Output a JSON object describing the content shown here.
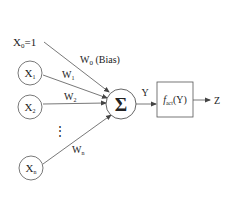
{
  "diagram": {
    "bias_input": {
      "label": "X",
      "sub": "0",
      "suffix": "=1"
    },
    "bias_weight": {
      "label": "W",
      "sub": "0",
      "suffix": " (Bias)"
    },
    "inputs": [
      {
        "label": "X",
        "sub": "1",
        "weight": "W",
        "weight_sub": "1"
      },
      {
        "label": "X",
        "sub": "2",
        "weight": "W",
        "weight_sub": "2"
      },
      {
        "label": "X",
        "sub": "n",
        "weight": "W",
        "weight_sub": "n"
      }
    ],
    "ellipsis": "⋮",
    "summation": "Σ",
    "sum_output": "Y",
    "activation": {
      "f": "f",
      "sub": "act",
      "arg": "(Y)"
    },
    "output": "Z",
    "stroke_color": "#555555",
    "text_color": "#222222"
  }
}
